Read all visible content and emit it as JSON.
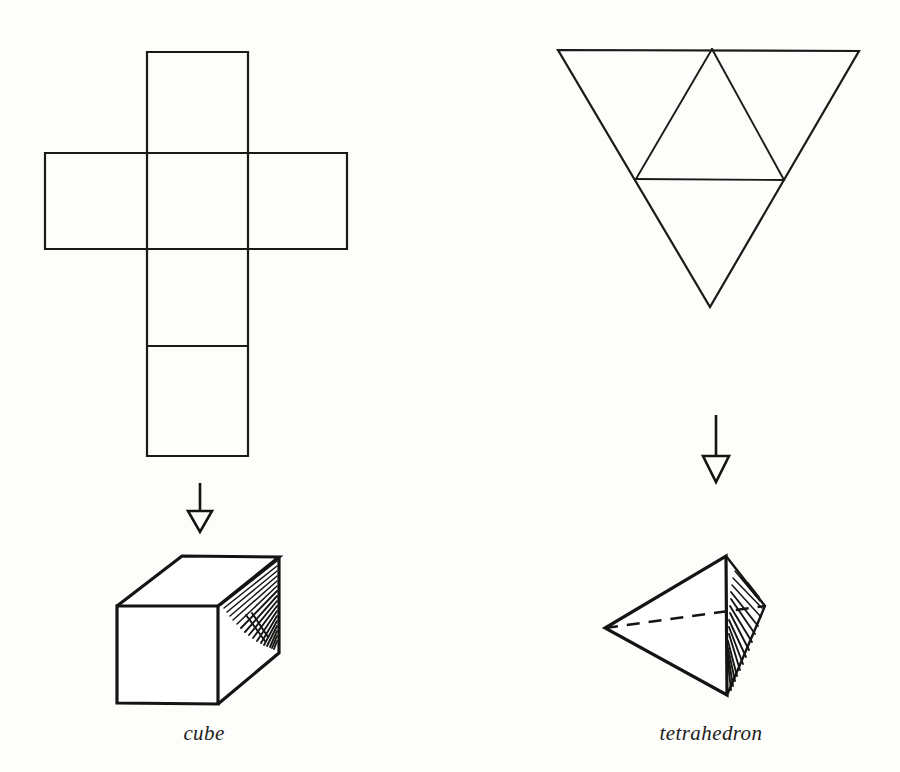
{
  "figure": {
    "background_color": "#fdfdfc",
    "ink_color": "#141412",
    "title": "",
    "panels": [
      {
        "id": "cube",
        "caption": "cube",
        "caption_x": 204,
        "caption_y": 740,
        "net": {
          "name": "cube-net",
          "shape": "latin-cross",
          "description": "Cross-shaped net of six squares: one vertical column of four squares with two squares flanking the second square from the top",
          "face_count": 6,
          "square_side_px": 100,
          "column_left_x": 147,
          "column_right_x": 248,
          "row_y": [
            52,
            153,
            249,
            346,
            456
          ],
          "band_left_x": 45,
          "band_right_x": 347
        },
        "arrow": {
          "name": "down-arrow",
          "x": 200,
          "y_start": 483,
          "y_shaft_end": 511,
          "y_tip": 532,
          "head_half_width": 12,
          "head_style": "hollow-triangle"
        },
        "solid": {
          "name": "cube-solid",
          "type": "cube",
          "shaded_face": "right",
          "shading_style": "fan-hatching",
          "hidden_edges_shown": false,
          "vertices": {
            "front_top_left": [
              117,
              606
            ],
            "front_top_right": [
              218,
              606
            ],
            "front_bottom_left": [
              117,
              703
            ],
            "front_bottom_right": [
              218,
              704
            ],
            "back_top_left": [
              182,
              556
            ],
            "back_top_right": [
              279,
              557
            ],
            "back_bottom_right": [
              279,
              653
            ]
          }
        }
      },
      {
        "id": "tetrahedron",
        "caption": "tetrahedron",
        "caption_x": 711,
        "caption_y": 740,
        "net": {
          "name": "tetrahedron-net",
          "shape": "subdivided-inverted-triangle",
          "description": "Large downward-pointing equilateral triangle subdivided by midlines into four smaller triangles",
          "face_count": 4,
          "outer_vertices": {
            "top_left": [
              558,
              50
            ],
            "top_right": [
              859,
              51
            ],
            "bottom_apex": [
              710,
              307
            ]
          },
          "midpoints": {
            "top_mid": [
              712,
              49
            ],
            "left_mid": [
              636,
              179
            ],
            "right_mid": [
              784,
              180
            ]
          }
        },
        "arrow": {
          "name": "down-arrow",
          "x": 716,
          "y_start": 415,
          "y_shaft_end": 456,
          "y_tip": 482,
          "head_half_width": 13,
          "head_style": "hollow-triangle"
        },
        "solid": {
          "name": "tetrahedron-solid",
          "type": "tetrahedron",
          "shaded_face": "right",
          "shading_style": "fan-hatching",
          "hidden_edges_shown": true,
          "hidden_edge_style": "dashed",
          "vertices": {
            "apex_top": [
              726,
              556
            ],
            "left": [
              605,
              628
            ],
            "bottom": [
              727,
              695
            ],
            "back_right": [
              765,
              606
            ]
          }
        }
      }
    ]
  }
}
